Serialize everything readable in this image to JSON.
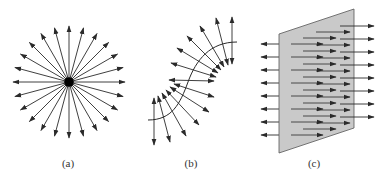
{
  "figure": {
    "panels": [
      {
        "id": "a",
        "label": "(a)",
        "description": "point charge with radial field lines pointing outward",
        "line_count": 24
      },
      {
        "id": "b",
        "label": "(b)",
        "description": "S-shaped curved charged sheet with field lines perpendicular on both sides"
      },
      {
        "id": "c",
        "label": "(c)",
        "description": "flat charged plane with uniform parallel field lines on both sides",
        "rows": 8
      }
    ]
  },
  "colors": {
    "line": "#2a2a2a",
    "plane_fill": "#c9c9c9",
    "plane_edge": "#555555",
    "hidden_line": "#888888",
    "charge": "#000000"
  }
}
